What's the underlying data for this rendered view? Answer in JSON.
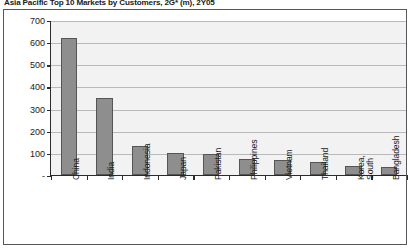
{
  "chart_data": {
    "type": "bar",
    "title": "Asia Pacific Top 10 Markets by Customers, 2G* (m), 2Y05",
    "xlabel": "",
    "ylabel": "",
    "categories": [
      "China",
      "India",
      "Indonesia",
      "Japan",
      "Pakistan",
      "Philippines",
      "Vietnam",
      "Thailand",
      "Korea,\nSouth",
      "Bangladesh"
    ],
    "values": [
      620,
      348,
      130,
      100,
      96,
      72,
      70,
      58,
      40,
      38
    ],
    "ylim": [
      0,
      700
    ],
    "yticks": [
      0,
      100,
      200,
      300,
      400,
      500,
      600,
      700
    ],
    "ytick_labels": [
      "-",
      "100",
      "200",
      "300",
      "400",
      "500",
      "600",
      "700"
    ],
    "grid": true,
    "legend": false,
    "bar_color": "#8e8e8e",
    "bar_edge_color": "#555555",
    "plot_background": "#f2f2f2",
    "axis_color": "#2b2b2b",
    "gridline_color": "#b9b9b9"
  }
}
